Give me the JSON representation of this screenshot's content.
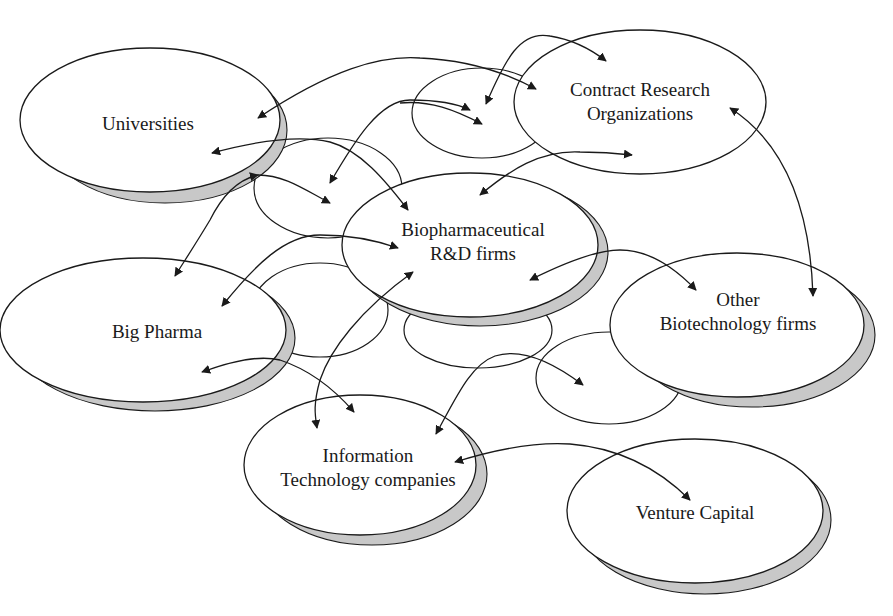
{
  "diagram": {
    "type": "network",
    "colors": {
      "stroke": "#1a1a1a",
      "shadow": "#c8c8c8",
      "background": "#ffffff"
    },
    "nodes": [
      {
        "id": "universities",
        "label_lines": [
          "Universities"
        ]
      },
      {
        "id": "cro",
        "label_lines": [
          "Contract Research",
          "Organizations"
        ]
      },
      {
        "id": "biopharma",
        "label_lines": [
          "Biopharmaceutical",
          "R&D firms"
        ]
      },
      {
        "id": "other_biotech",
        "label_lines": [
          "Other",
          "Biotechnology firms"
        ]
      },
      {
        "id": "big_pharma",
        "label_lines": [
          "Big Pharma"
        ]
      },
      {
        "id": "info_tech",
        "label_lines": [
          "Information",
          "Technology companies"
        ]
      },
      {
        "id": "venture_capital",
        "label_lines": [
          "Venture Capital"
        ]
      }
    ],
    "edges": [
      {
        "from": "universities",
        "to": "cro",
        "bidirectional": true
      },
      {
        "from": "universities",
        "to": "biopharma",
        "bidirectional": true
      },
      {
        "from": "universities",
        "to": "big_pharma",
        "bidirectional": true
      },
      {
        "from": "cro",
        "to": "biopharma",
        "bidirectional": true
      },
      {
        "from": "cro",
        "to": "other_biotech",
        "bidirectional": true
      },
      {
        "from": "biopharma",
        "to": "big_pharma",
        "bidirectional": true
      },
      {
        "from": "biopharma",
        "to": "other_biotech",
        "bidirectional": true
      },
      {
        "from": "biopharma",
        "to": "info_tech",
        "bidirectional": true
      },
      {
        "from": "big_pharma",
        "to": "info_tech",
        "bidirectional": true
      },
      {
        "from": "other_biotech",
        "to": "info_tech",
        "bidirectional": true
      },
      {
        "from": "info_tech",
        "to": "venture_capital",
        "bidirectional": true
      }
    ]
  }
}
